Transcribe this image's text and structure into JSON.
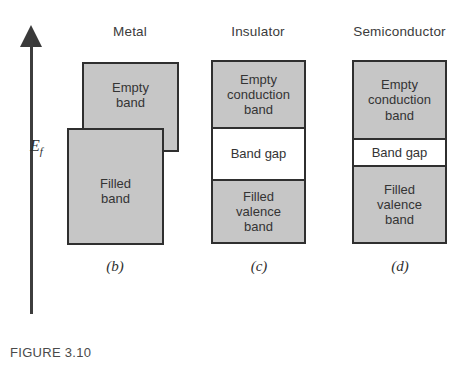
{
  "figure": {
    "caption": "FIGURE 3.10",
    "axis": {
      "name": "energy-axis",
      "label": "E",
      "label_subscript": "f",
      "direction": "up"
    },
    "colors": {
      "band_fill": "#c6c6c6",
      "gap_fill": "#ffffff",
      "border": "#2f2f2f",
      "text": "#343434",
      "background": "#ffffff"
    },
    "columns": [
      {
        "key": "metal",
        "header": "Metal",
        "sub_label": "(b)",
        "boxes": [
          {
            "key": "empty",
            "label": "Empty\nband",
            "filled": true
          },
          {
            "key": "filled",
            "label": "Filled\nband",
            "filled": true
          }
        ]
      },
      {
        "key": "insulator",
        "header": "Insulator",
        "sub_label": "(c)",
        "boxes": [
          {
            "key": "conduction",
            "label": "Empty\nconduction\nband",
            "filled": true
          },
          {
            "key": "gap",
            "label": "Band gap",
            "filled": false
          },
          {
            "key": "valence",
            "label": "Filled\nvalence\nband",
            "filled": true
          }
        ]
      },
      {
        "key": "semiconductor",
        "header": "Semiconductor",
        "sub_label": "(d)",
        "boxes": [
          {
            "key": "conduction",
            "label": "Empty\nconduction\nband",
            "filled": true
          },
          {
            "key": "gap",
            "label": "Band gap",
            "filled": false
          },
          {
            "key": "valence",
            "label": "Filled\nvalence\nband",
            "filled": true
          }
        ]
      }
    ]
  }
}
